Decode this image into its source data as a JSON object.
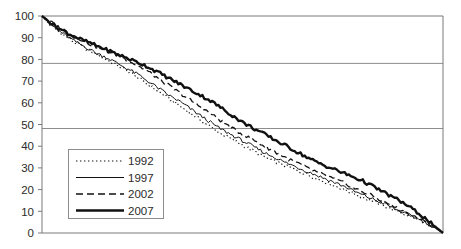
{
  "chart_data": {
    "type": "line",
    "title": "",
    "subtitle": "",
    "xlabel": "",
    "ylabel": "",
    "grid": "horizontal gridlines at 50 and 80",
    "legend_position": "inside lower-left",
    "ylim": [
      0,
      100
    ],
    "yticks": [
      0,
      10,
      20,
      30,
      40,
      50,
      60,
      70,
      80,
      90,
      100
    ],
    "ytick_labels": [
      "0",
      "10",
      "20",
      "30",
      "40",
      "50",
      "60",
      "70",
      "80",
      "90",
      "100"
    ],
    "gridline_values": [
      50,
      80
    ],
    "xlim": [
      0,
      100
    ],
    "xticks": [],
    "xtick_labels": [],
    "legend": [
      {
        "name": "1992",
        "style": "dotted",
        "width": 1.0,
        "color": "#111111"
      },
      {
        "name": "1997",
        "style": "solid-thin",
        "width": 1.0,
        "color": "#111111"
      },
      {
        "name": "2002",
        "style": "dashed",
        "width": 1.2,
        "color": "#111111"
      },
      {
        "name": "2007",
        "style": "solid-thick",
        "width": 2.6,
        "color": "#111111"
      }
    ],
    "x": [
      0,
      2,
      4,
      6,
      8,
      10,
      12,
      14,
      16,
      18,
      20,
      22,
      24,
      26,
      28,
      30,
      32,
      34,
      36,
      38,
      40,
      42,
      44,
      46,
      48,
      50,
      52,
      54,
      56,
      58,
      60,
      62,
      64,
      66,
      68,
      70,
      72,
      74,
      76,
      78,
      80,
      82,
      84,
      86,
      88,
      90,
      92,
      94,
      96,
      98,
      100
    ],
    "series": [
      {
        "name": "1992",
        "style": "dotted",
        "values": [
          100,
          96,
          93,
          90.5,
          88,
          86,
          84,
          82,
          80,
          78,
          76,
          74,
          71.5,
          69,
          66.5,
          64,
          61.5,
          59,
          56.5,
          54,
          51.5,
          49,
          46.5,
          44.5,
          42.5,
          40.5,
          38.5,
          36.5,
          34.5,
          33,
          31.5,
          30,
          28.5,
          27,
          25.5,
          24,
          22.5,
          21,
          19.5,
          18,
          16.5,
          15,
          13.5,
          12,
          10.5,
          9,
          7.5,
          6,
          4.5,
          2.5,
          0
        ]
      },
      {
        "name": "1997",
        "style": "solid-thin",
        "values": [
          100,
          96.5,
          93.5,
          91,
          88.5,
          86.5,
          84.5,
          82.5,
          81,
          79,
          77,
          75,
          73,
          70.5,
          68,
          65.5,
          63,
          61,
          58.5,
          56,
          53.5,
          51,
          48.5,
          46.5,
          44.5,
          42.5,
          40.5,
          38.5,
          36.5,
          35,
          33,
          31.5,
          30,
          28.5,
          27,
          25.5,
          24,
          22.5,
          21,
          19,
          17.5,
          16,
          14.5,
          13,
          11,
          9.5,
          8,
          6.5,
          4.5,
          2.5,
          0
        ]
      },
      {
        "name": "2002",
        "style": "dashed",
        "values": [
          100,
          97.5,
          95,
          93,
          91,
          89,
          87,
          85.5,
          84,
          82.5,
          81,
          79,
          77,
          75,
          72.5,
          70,
          67.5,
          65,
          62.5,
          60,
          57.5,
          55,
          52.5,
          50,
          47.5,
          45.5,
          43.5,
          41.5,
          39.5,
          37.5,
          35.5,
          33.5,
          32,
          30,
          28.5,
          27,
          25.5,
          24,
          22.5,
          20.5,
          19,
          17.5,
          15.5,
          14,
          12,
          10,
          8.5,
          6.5,
          4.5,
          2.5,
          0
        ]
      },
      {
        "name": "2007",
        "style": "solid-thick",
        "values": [
          100,
          97,
          94.5,
          92.5,
          90.5,
          89,
          87.5,
          86,
          84.5,
          83,
          81.5,
          80,
          78.5,
          77,
          75,
          73,
          71,
          69,
          67,
          65,
          63,
          61,
          58.5,
          56,
          53.5,
          51,
          49,
          47,
          45,
          43,
          41,
          39,
          37,
          35,
          33,
          31.5,
          30,
          28.5,
          27,
          25.5,
          24,
          22,
          20,
          18,
          16,
          14,
          11.5,
          9,
          6,
          3,
          0
        ]
      }
    ]
  }
}
